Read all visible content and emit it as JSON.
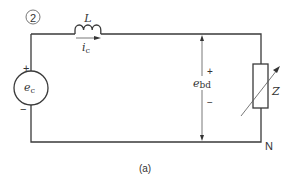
{
  "diagram": {
    "node_number": "2",
    "inductor_label": "L",
    "current_label": "i",
    "current_sub": "c",
    "source_label": "e",
    "source_sub": "c",
    "source_plus": "+",
    "source_minus": "−",
    "voltage_label": "e",
    "voltage_sub": "bd",
    "voltage_plus": "+",
    "voltage_minus": "−",
    "impedance_label": "Z",
    "neutral_label": "N",
    "caption": "(a)"
  },
  "colors": {
    "line": "#3a3a3a",
    "background": "#ffffff"
  }
}
